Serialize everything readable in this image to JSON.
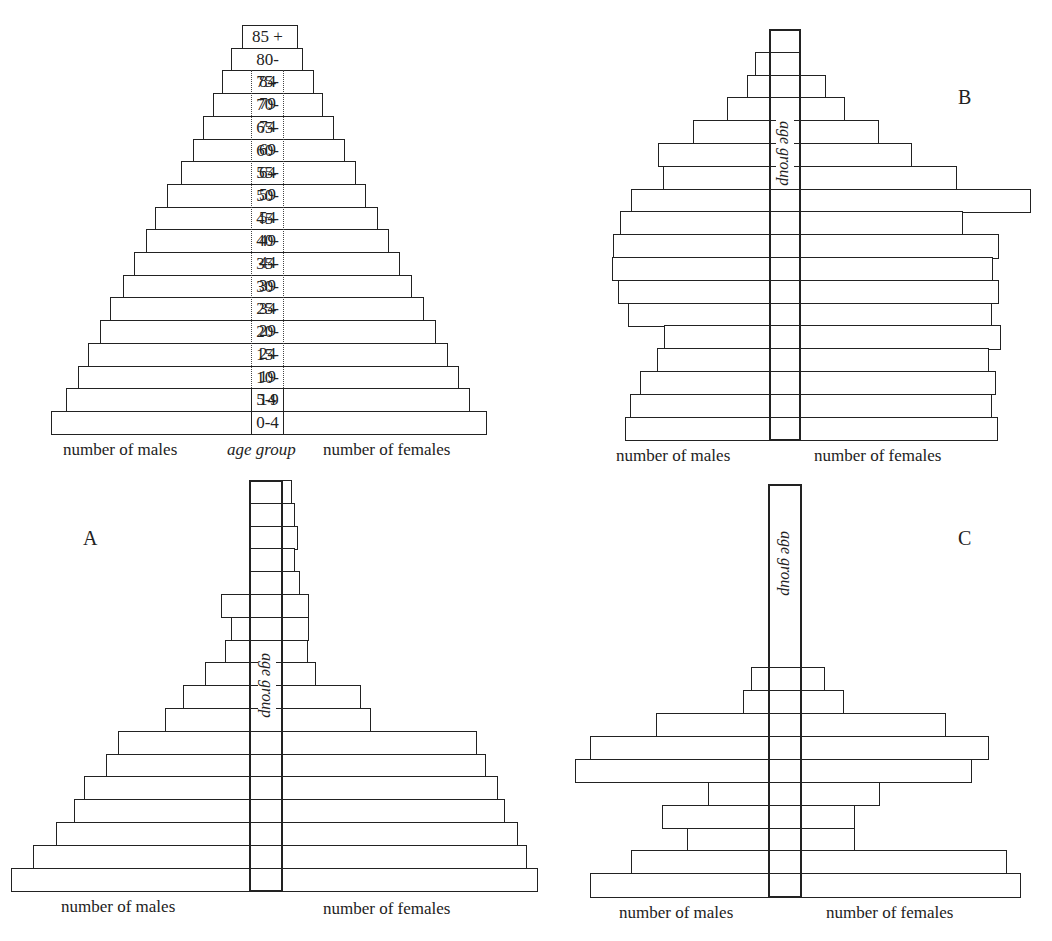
{
  "figure": {
    "age_groups": [
      "85 +",
      "80-84",
      "75-79",
      "70-74",
      "65-69",
      "60-64",
      "55-59",
      "50-54",
      "45-49",
      "40-44",
      "35-39",
      "30-34",
      "25-29",
      "20-24",
      "15-19",
      "10-14",
      "5-9",
      "0-4"
    ],
    "labels": {
      "males": "number of males",
      "females": "number of females",
      "age_group": "age group"
    }
  },
  "chart_data": [
    {
      "type": "bar",
      "id": "key",
      "title": "",
      "letter": "",
      "orientation": "horizontal-population-pyramid",
      "categories": [
        "85 +",
        "80-84",
        "75-79",
        "70-74",
        "65-69",
        "60-64",
        "55-59",
        "50-54",
        "45-49",
        "40-44",
        "35-39",
        "30-34",
        "25-29",
        "20-24",
        "15-19",
        "10-14",
        "5-9",
        "0-4"
      ],
      "series": [
        {
          "name": "number of males",
          "values": [
            9,
            20,
            29,
            38,
            48,
            58,
            70,
            84,
            96,
            105,
            117,
            128,
            141,
            151,
            163,
            173,
            185,
            200
          ]
        },
        {
          "name": "number of females",
          "values": [
            14,
            19,
            30,
            39,
            50,
            61,
            72,
            82,
            94,
            105,
            116,
            128,
            140,
            152,
            164,
            175,
            186,
            203
          ]
        }
      ],
      "xlabel_left": "number of males",
      "xlabel_center": "age group",
      "xlabel_right": "number of females",
      "units": "relative bar length (px)",
      "geometry": {
        "center_left": 251,
        "center_right": 284,
        "top": 25,
        "row_h": 22.7
      }
    },
    {
      "type": "bar",
      "id": "B",
      "letter": "B",
      "orientation": "horizontal-population-pyramid",
      "categories": [
        "85 +",
        "80-84",
        "75-79",
        "70-74",
        "65-69",
        "60-64",
        "55-59",
        "50-54",
        "45-49",
        "40-44",
        "35-39",
        "30-34",
        "25-29",
        "20-24",
        "15-19",
        "10-14",
        "5-9",
        "0-4"
      ],
      "series": [
        {
          "name": "number of males",
          "values": [
            0,
            14,
            22,
            42,
            76,
            111,
            106,
            138,
            149,
            156,
            157,
            151,
            141,
            105,
            112,
            129,
            139,
            144
          ]
        },
        {
          "name": "number of females",
          "values": [
            0,
            0,
            25,
            44,
            78,
            111,
            156,
            230,
            162,
            198,
            192,
            198,
            191,
            200,
            188,
            195,
            191,
            197
          ]
        }
      ],
      "xlabel_left": "number of males",
      "xlabel_right": "number of females",
      "center_text": "age group",
      "geometry": {
        "center_left": 769,
        "center_right": 801,
        "top": 29,
        "row_h": 22.8
      }
    },
    {
      "type": "bar",
      "id": "A",
      "letter": "A",
      "orientation": "horizontal-population-pyramid",
      "categories": [
        "85 +",
        "80-84",
        "75-79",
        "70-74",
        "65-69",
        "60-64",
        "55-59",
        "50-54",
        "45-49",
        "40-44",
        "35-39",
        "30-34",
        "25-29",
        "20-24",
        "15-19",
        "10-14",
        "5-9",
        "0-4"
      ],
      "series": [
        {
          "name": "number of males",
          "values": [
            0,
            0,
            0,
            0,
            0,
            28,
            18,
            24,
            44,
            66,
            84,
            131,
            143,
            165,
            175,
            193,
            216,
            238
          ]
        },
        {
          "name": "number of females",
          "values": [
            9,
            12,
            15,
            12,
            17,
            26,
            26,
            25,
            33,
            78,
            88,
            194,
            203,
            215,
            222,
            235,
            244,
            255
          ]
        }
      ],
      "xlabel_left": "number of males",
      "xlabel_right": "number of females",
      "center_text": "age group",
      "geometry": {
        "center_left": 249,
        "center_right": 283,
        "top": 480,
        "row_h": 22.8
      }
    },
    {
      "type": "bar",
      "id": "C",
      "letter": "C",
      "orientation": "horizontal-population-pyramid",
      "categories": [
        "85 +",
        "80-84",
        "75-79",
        "70-74",
        "65-69",
        "60-64",
        "55-59",
        "50-54",
        "45-49",
        "40-44",
        "35-39",
        "30-34",
        "25-29",
        "20-24",
        "15-19",
        "10-14",
        "5-9",
        "0-4"
      ],
      "series": [
        {
          "name": "number of males",
          "values": [
            0,
            0,
            0,
            0,
            0,
            0,
            0,
            0,
            17,
            25,
            112,
            178,
            193,
            60,
            106,
            81,
            137,
            178
          ]
        },
        {
          "name": "number of females",
          "values": [
            0,
            0,
            0,
            0,
            0,
            0,
            0,
            0,
            23,
            42,
            144,
            187,
            170,
            78,
            53,
            53,
            205,
            219
          ]
        }
      ],
      "xlabel_left": "number of males",
      "xlabel_right": "number of females",
      "center_text": "age group",
      "geometry": {
        "center_left": 768,
        "center_right": 802,
        "top": 484,
        "row_h": 22.9
      }
    }
  ],
  "annotations": {
    "letter_A": "A",
    "letter_B": "B",
    "letter_C": "C"
  }
}
